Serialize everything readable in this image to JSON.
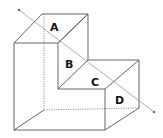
{
  "diagram": {
    "type": "L-shaped block with section line",
    "labels": [
      {
        "id": "A",
        "text": "A",
        "x": 56,
        "y": 29
      },
      {
        "id": "B",
        "text": "B",
        "x": 69,
        "y": 67
      },
      {
        "id": "C",
        "text": "C",
        "x": 94,
        "y": 85
      },
      {
        "id": "D",
        "text": "D",
        "x": 118,
        "y": 104
      }
    ],
    "colors": {
      "edge": "#555555",
      "hidden": "#777777",
      "label": "#111111",
      "background": "#ffffff"
    }
  }
}
